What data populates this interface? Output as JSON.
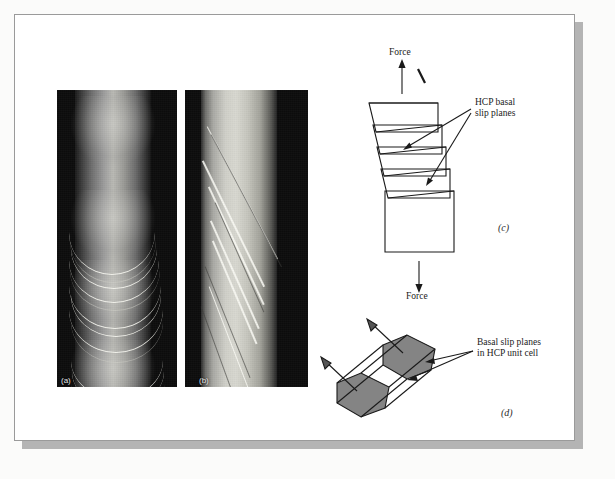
{
  "figure": {
    "panels": [
      {
        "id": "a",
        "label": "(a)",
        "kind": "photomicrograph",
        "description": "dark cylindrical metal specimen with curved crescent slip bands"
      },
      {
        "id": "b",
        "label": "(b)",
        "kind": "photomicrograph",
        "description": "bright cylindrical metal specimen with diagonal slip band traces"
      },
      {
        "id": "c",
        "label": "(c)",
        "kind": "line-diagram",
        "description": "stepped block sheared along inclined basal slip planes under tension"
      },
      {
        "id": "d",
        "label": "(d)",
        "kind": "line-diagram",
        "description": "HCP unit cell drawn as hexagonal prism with shaded basal planes"
      }
    ],
    "annotations": {
      "force_top": "Force",
      "force_bottom": "Force",
      "hcp_basal_slip_planes": "HCP basal\nslip planes",
      "basal_slip_planes_cell": "Basal slip planes\nin HCP unit cell"
    },
    "colors": {
      "page_background": "#ffffff",
      "outer_background": "#fbfbfa",
      "page_border": "#9a9a9a",
      "page_shadow": "#b4b4b4",
      "line_art_stroke": "#1a1a1a",
      "shaded_plane_fill": "#848484",
      "photo_dark": "#0d0d0d",
      "photo_highlight": "#f6f6f0"
    }
  }
}
